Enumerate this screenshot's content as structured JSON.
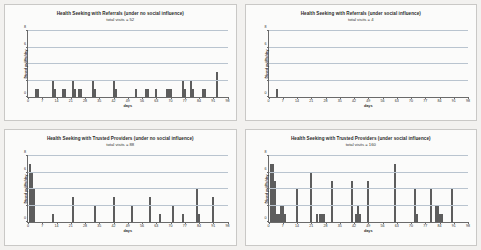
{
  "chart_data": [
    {
      "type": "bar",
      "panel": "top-left",
      "title": "Health Seeking with Referrals (under no social influence)",
      "subtitle": "total visits = 52",
      "xlabel": "days",
      "ylabel": "Dosed public/day",
      "xlim": [
        0,
        98
      ],
      "ylim": [
        0,
        8
      ],
      "yticks": [
        0,
        2,
        4,
        6,
        8
      ],
      "xticks": [
        0,
        7,
        14,
        21,
        28,
        35,
        42,
        49,
        56,
        63,
        70,
        77,
        84,
        91,
        98
      ],
      "grid": true,
      "x": [
        4,
        5,
        12,
        13,
        17,
        18,
        22,
        23,
        25,
        26,
        32,
        33,
        42,
        43,
        53,
        58,
        59,
        63,
        68,
        69,
        70,
        76,
        77,
        80,
        81,
        86,
        87,
        93
      ],
      "values": [
        1,
        1,
        2,
        1,
        1,
        1,
        2,
        1,
        1,
        1,
        2,
        1,
        2,
        1,
        1,
        1,
        1,
        1,
        1,
        1,
        1,
        2,
        1,
        2,
        1,
        1,
        1,
        3
      ]
    },
    {
      "type": "bar",
      "panel": "top-right",
      "title": "Health Seeking with Referrals (under social influence)",
      "subtitle": "total visits = 4",
      "xlabel": "days",
      "ylabel": "Dosed public/day",
      "xlim": [
        0,
        98
      ],
      "ylim": [
        0,
        8
      ],
      "yticks": [
        0,
        2,
        4,
        6,
        8
      ],
      "xticks": [
        0,
        7,
        14,
        21,
        28,
        35,
        42,
        49,
        56,
        63,
        70,
        77,
        84,
        91,
        98
      ],
      "grid": true,
      "x": [
        4
      ],
      "values": [
        1
      ]
    },
    {
      "type": "bar",
      "panel": "bottom-left",
      "title": "Health Seeking with Trusted Providers (under no social influence)",
      "subtitle": "total visits = 88",
      "xlabel": "days",
      "ylabel": "Dosed public/day",
      "xlim": [
        0,
        98
      ],
      "ylim": [
        0,
        8
      ],
      "yticks": [
        0,
        2,
        4,
        6,
        8
      ],
      "xticks": [
        0,
        7,
        14,
        21,
        28,
        35,
        42,
        49,
        56,
        63,
        70,
        77,
        84,
        91,
        98
      ],
      "grid": true,
      "x": [
        1,
        2,
        3,
        12,
        22,
        33,
        42,
        51,
        60,
        65,
        71,
        76,
        83,
        84,
        91
      ],
      "values": [
        7,
        6,
        4,
        1,
        3,
        2,
        3,
        2,
        3,
        1,
        2,
        1,
        4,
        1,
        3
      ]
    },
    {
      "type": "bar",
      "panel": "bottom-right",
      "title": "Health Seeking with Trusted Providers (under social influence)",
      "subtitle": "total visits = 160",
      "xlabel": "days",
      "ylabel": "Dosed public/day",
      "xlim": [
        0,
        98
      ],
      "ylim": [
        0,
        8
      ],
      "yticks": [
        0,
        2,
        4,
        6,
        8
      ],
      "xticks": [
        0,
        7,
        14,
        21,
        28,
        35,
        42,
        49,
        56,
        63,
        70,
        77,
        84,
        91,
        98
      ],
      "grid": true,
      "x": [
        1,
        2,
        3,
        4,
        5,
        6,
        7,
        8,
        14,
        21,
        24,
        25,
        26,
        27,
        31,
        41,
        43,
        44,
        45,
        49,
        62,
        72,
        73,
        80,
        82,
        83,
        84,
        85,
        90
      ],
      "values": [
        7,
        7,
        5,
        1,
        1,
        2,
        2,
        1,
        4,
        6,
        1,
        1,
        1,
        1,
        5,
        5,
        1,
        2,
        1,
        5,
        7,
        4,
        1,
        4,
        2,
        2,
        1,
        1,
        4
      ]
    }
  ]
}
